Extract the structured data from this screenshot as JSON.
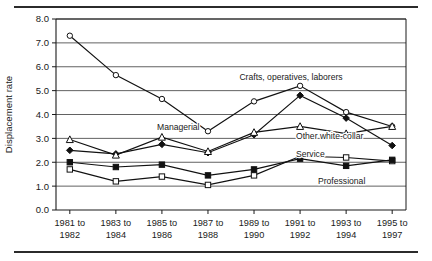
{
  "figure": {
    "has_top_rule": true,
    "has_bottom_rule": true
  },
  "chart_data": {
    "type": "line",
    "title": "",
    "subtitle": "",
    "xlabel": "",
    "ylabel": "Displacement rate",
    "ylim": [
      0.0,
      8.0
    ],
    "ytick_step": 1.0,
    "yticks": [
      "0.0",
      "1.0",
      "2.0",
      "3.0",
      "4.0",
      "5.0",
      "6.0",
      "7.0",
      "8.0"
    ],
    "grid": "horizontal",
    "legend_position": "inline-annotations",
    "categories": [
      "1981 to\n1982",
      "1983 to\n1984",
      "1985 to\n1986",
      "1987 to\n1988",
      "1989 to\n1990",
      "1991 to\n1992",
      "1993 to\n1994",
      "1995 to\n1997"
    ],
    "category_lines": [
      [
        "1981 to",
        "1982"
      ],
      [
        "1983 to",
        "1984"
      ],
      [
        "1985 to",
        "1986"
      ],
      [
        "1987 to",
        "1988"
      ],
      [
        "1989 to",
        "1990"
      ],
      [
        "1991 to",
        "1992"
      ],
      [
        "1993 to",
        "1994"
      ],
      [
        "1995 to",
        "1997"
      ]
    ],
    "series": [
      {
        "name": "Crafts, operatives, laborers",
        "marker": "open-circle",
        "values": [
          7.3,
          5.65,
          4.65,
          3.3,
          4.55,
          5.2,
          4.1,
          3.5
        ],
        "label_x": 291,
        "label_y": 80,
        "label_anchor": "middle"
      },
      {
        "name": "Managerial",
        "marker": "filled-diamond",
        "values": [
          2.5,
          2.35,
          2.75,
          2.4,
          3.15,
          4.8,
          3.85,
          2.7
        ],
        "label_x": 157,
        "label_y": 130,
        "label_anchor": "start"
      },
      {
        "name": "Other white-collar",
        "marker": "open-triangle",
        "values": [
          2.95,
          2.3,
          3.05,
          2.45,
          3.25,
          3.5,
          3.2,
          3.5
        ],
        "label_x": 296,
        "label_y": 139,
        "label_anchor": "start"
      },
      {
        "name": "Service",
        "marker": "open-square",
        "values": [
          1.7,
          1.2,
          1.4,
          1.05,
          1.45,
          2.25,
          2.2,
          2.05
        ],
        "label_x": 296,
        "label_y": 157,
        "label_anchor": "start"
      },
      {
        "name": "Professional",
        "marker": "filled-square",
        "values": [
          2.0,
          1.8,
          1.9,
          1.45,
          1.7,
          2.15,
          1.85,
          2.1
        ],
        "label_x": 318,
        "label_y": 184,
        "label_anchor": "start"
      }
    ]
  },
  "colors": {
    "ink": "#111111",
    "grid": "#3a3a3a",
    "background": "#ffffff"
  }
}
